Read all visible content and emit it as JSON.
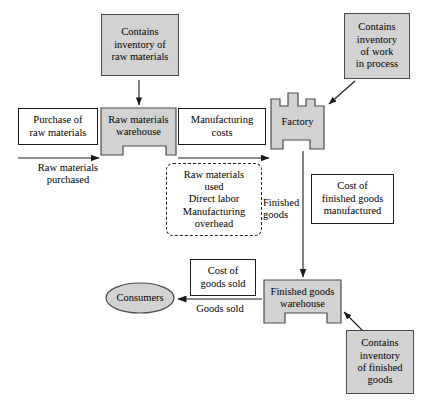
{
  "diagram": {
    "colors": {
      "shape_fill": "#d2d2d2",
      "shape_stroke": "#4a4a4a",
      "box_fill": "#ffffff",
      "box_stroke": "#1a1a1a",
      "arrow": "#1a1a1a",
      "background": "#ffffff"
    },
    "nodes": {
      "contains_inventory_raw_materials": {
        "lines": [
          "Contains",
          "inventory of",
          "raw materials"
        ],
        "style": "gray-box"
      },
      "contains_inventory_work_in_process": {
        "lines": [
          "Contains",
          "inventory",
          "of work",
          "in process"
        ],
        "style": "gray-box"
      },
      "purchase_of_raw_materials": {
        "lines": [
          "Purchase of",
          "raw materials"
        ],
        "style": "white-box"
      },
      "raw_materials_warehouse": {
        "lines": [
          "Raw materials",
          "warehouse"
        ],
        "style": "warehouse-shape"
      },
      "manufacturing_costs": {
        "lines": [
          "Manufacturing",
          "costs"
        ],
        "style": "white-box"
      },
      "factory": {
        "lines": [
          "Factory"
        ],
        "style": "factory-shape"
      },
      "manufacturing_cost_components": {
        "lines": [
          "Raw materials",
          "used",
          "Direct labor",
          "Manufacturing",
          "overhead"
        ],
        "style": "dashed-box"
      },
      "cost_of_finished_goods_manufactured": {
        "lines": [
          "Cost of",
          "finished goods",
          "manufactured"
        ],
        "style": "white-box"
      },
      "cost_of_goods_sold": {
        "lines": [
          "Cost of",
          "goods sold"
        ],
        "style": "white-box"
      },
      "finished_goods_warehouse": {
        "lines": [
          "Finished goods",
          "warehouse"
        ],
        "style": "warehouse-shape"
      },
      "consumers": {
        "lines": [
          "Consumers"
        ],
        "style": "ellipse-shape"
      },
      "contains_inventory_finished_goods": {
        "lines": [
          "Contains",
          "inventory",
          "of finished",
          "goods"
        ],
        "style": "gray-box"
      }
    },
    "arrow_labels": {
      "raw_materials_purchased": {
        "lines": [
          "Raw materials",
          "purchased"
        ]
      },
      "finished_goods": {
        "lines": [
          "Finished",
          "goods"
        ]
      },
      "goods_sold": {
        "lines": [
          "Goods sold"
        ]
      }
    },
    "connections": [
      {
        "name": "inventory-raw-to-warehouse",
        "from": "contains_inventory_raw_materials",
        "to": "raw_materials_warehouse",
        "direction": "down",
        "label": ""
      },
      {
        "name": "purchase-to-warehouse",
        "from": "purchase_of_raw_materials",
        "to": "raw_materials_warehouse",
        "direction": "right",
        "label": "Raw materials purchased"
      },
      {
        "name": "warehouse-to-factory",
        "from": "raw_materials_warehouse",
        "to": "factory",
        "direction": "right",
        "label": "Manufacturing costs"
      },
      {
        "name": "inventory-wip-to-factory",
        "from": "contains_inventory_work_in_process",
        "to": "factory",
        "direction": "down-left",
        "label": ""
      },
      {
        "name": "factory-to-finished-goods-warehouse",
        "from": "factory",
        "to": "finished_goods_warehouse",
        "direction": "down",
        "label": "Finished goods"
      },
      {
        "name": "finished-goods-warehouse-to-consumers",
        "from": "finished_goods_warehouse",
        "to": "consumers",
        "direction": "left",
        "label": "Goods sold"
      },
      {
        "name": "inventory-finished-to-warehouse",
        "from": "contains_inventory_finished_goods",
        "to": "finished_goods_warehouse",
        "direction": "up-left",
        "label": ""
      }
    ]
  }
}
